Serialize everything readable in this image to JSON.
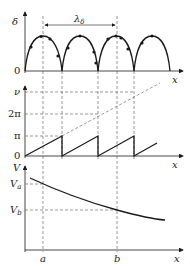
{
  "figure": {
    "panels": [
      {
        "id": "delta-panel",
        "y_label": "δ",
        "x_label": "x",
        "origin_label": "0",
        "span_label": "λ",
        "span_label_sub": "δ",
        "description": "periodic arches of δ vs x with sample points"
      },
      {
        "id": "phase-panel",
        "y_label": "ν",
        "x_label": "x",
        "origin_label": "0",
        "ticks": [
          "ν",
          "2π",
          "π"
        ],
        "description": "sawtooth phase wrapped modulo π, with dashed unwrapped line"
      },
      {
        "id": "potential-panel",
        "y_label": "V",
        "x_label": "x",
        "ticks": [
          {
            "label": "V",
            "sub": "a"
          },
          {
            "label": "V",
            "sub": "b"
          }
        ],
        "x_ticks": [
          "a",
          "b"
        ],
        "description": "decreasing potential V vs x"
      }
    ],
    "colors": {
      "line": "#1a1a1a",
      "dashed": "#555555",
      "background": "#ffffff"
    }
  }
}
